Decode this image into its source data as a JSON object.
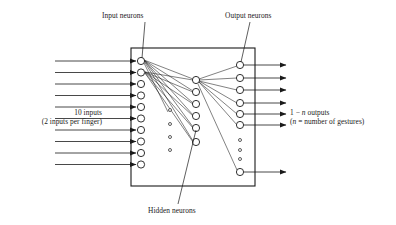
{
  "figure": {
    "labels": {
      "input_neurons": "Input neurons",
      "output_neurons": "Output neurons",
      "hidden_neurons": "Hidden neurons",
      "inputs_count": "10 inputs",
      "inputs_detail_pre": "(2 inputs per finger)",
      "outputs_count_pre": "1 − ",
      "outputs_count_var": "n",
      "outputs_count_post": " outputs",
      "outputs_detail_pre": "(",
      "outputs_detail_var": "n",
      "outputs_detail_post": " = number of gestures)"
    },
    "colors": {
      "stroke": "#1a1a1a",
      "neuron_fill": "#ffffff",
      "background": "#ffffff"
    },
    "network": {
      "input_layer": {
        "name": "input-neuron-layer",
        "count": 10,
        "cx": 141,
        "radius": 3.6,
        "cy": [
          61,
          72.5,
          84,
          95.5,
          107,
          118.5,
          130,
          141.5,
          153,
          164.5
        ]
      },
      "hidden_layer": {
        "name": "hidden-neuron-layer",
        "count": 6,
        "cx": 196,
        "radius": 3.6,
        "cy": [
          80,
          92,
          104,
          116,
          128,
          142
        ],
        "ellipsis_cx": 170,
        "ellipsis_cy": [
          110,
          124,
          137,
          150
        ],
        "ellipsis_r": 1.5
      },
      "output_layer": {
        "name": "output-neuron-layer",
        "count": 7,
        "cx": 240,
        "radius": 3.6,
        "cy": [
          65,
          78,
          90,
          103,
          114,
          125,
          172
        ],
        "ellipsis_cx": 240,
        "ellipsis_cy": [
          140,
          150,
          159
        ],
        "ellipsis_r": 1.5
      },
      "box": {
        "x": 131,
        "y": 48,
        "width": 124,
        "height": 138
      },
      "input_arrows": {
        "x_start": 55,
        "x_end": 138,
        "y": [
          61,
          72.5,
          84,
          95.5,
          107,
          118.5,
          130,
          141.5,
          153,
          164.5
        ]
      },
      "output_arrows": {
        "x_start": 244,
        "x_end": 288,
        "y": [
          65,
          78,
          90,
          103,
          114,
          125,
          172
        ]
      }
    },
    "leaders": [
      {
        "name": "leader-input-neurons",
        "x1": 145,
        "y1": 22,
        "x2": 142,
        "y2": 58
      },
      {
        "name": "leader-output-neurons",
        "x1": 250,
        "y1": 22,
        "x2": 241,
        "y2": 62
      },
      {
        "name": "leader-hidden-neurons",
        "x1": 178,
        "y1": 204,
        "x2": 196,
        "y2": 130
      }
    ]
  }
}
